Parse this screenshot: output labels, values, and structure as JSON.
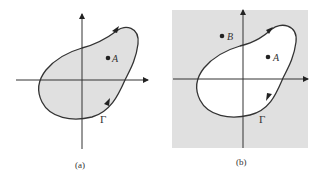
{
  "figure": {
    "panels": [
      {
        "id": "a",
        "caption": "(a)",
        "points": [
          {
            "label": "A"
          }
        ],
        "curve_label": "Γ",
        "shading": "interior shaded",
        "orientation": "counterclockwise"
      },
      {
        "id": "b",
        "caption": "(b)",
        "points": [
          {
            "label": "B"
          },
          {
            "label": "A"
          }
        ],
        "curve_label": "Γ",
        "shading": "exterior shaded",
        "orientation": "clockwise"
      }
    ]
  },
  "colors": {
    "shade": "#e0e0e0",
    "stroke": "#333333",
    "background": "#ffffff"
  }
}
